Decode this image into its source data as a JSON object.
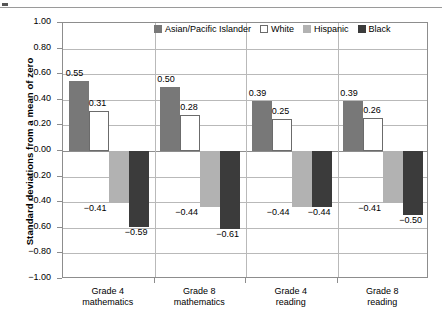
{
  "chart_data": {
    "type": "bar",
    "title": "",
    "xlabel": "",
    "ylabel": "Standard deviations from a mean of zero",
    "ylim": [
      -1.0,
      1.0
    ],
    "ytick_step": 0.2,
    "grid": true,
    "legend_position": "top-right-inside",
    "categories": [
      [
        "Grade 4",
        "mathematics"
      ],
      [
        "Grade 8",
        "mathematics"
      ],
      [
        "Grade 4",
        "reading"
      ],
      [
        "Grade 8",
        "reading"
      ]
    ],
    "ytick_labels": [
      "1.00",
      "0.80",
      "0.60",
      "0.40",
      "0.20",
      "0.00",
      "−0.20",
      "−0.40",
      "−0.60",
      "−0.80",
      "−1.00"
    ],
    "ytick_values": [
      1.0,
      0.8,
      0.6,
      0.4,
      0.2,
      0.0,
      -0.2,
      -0.4,
      -0.6,
      -0.8,
      -1.0
    ],
    "series": [
      {
        "name": "Asian/Pacific Islander",
        "color": "#787878",
        "values": [
          0.55,
          0.5,
          0.39,
          0.39
        ],
        "labels": [
          "0.55",
          "0.50",
          "0.39",
          "0.39"
        ]
      },
      {
        "name": "White",
        "color": "#ffffff",
        "values": [
          0.31,
          0.28,
          0.25,
          0.26
        ],
        "labels": [
          "0.31",
          "0.28",
          "0.25",
          "0.26"
        ]
      },
      {
        "name": "Hispanic",
        "color": "#b2b2b2",
        "values": [
          -0.41,
          -0.44,
          -0.44,
          -0.41
        ],
        "labels": [
          "−0.41",
          "−0.44",
          "−0.44",
          "−0.41"
        ]
      },
      {
        "name": "Black",
        "color": "#3b3b3b",
        "values": [
          -0.59,
          -0.61,
          -0.44,
          -0.5
        ],
        "labels": [
          "−0.59",
          "−0.61",
          "−0.44",
          "−0.50"
        ]
      }
    ]
  }
}
